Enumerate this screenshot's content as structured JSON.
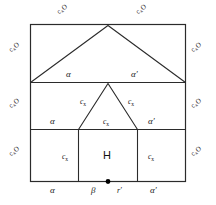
{
  "figure": {
    "stroke_color": "#2b2b2b",
    "text_color": "#1a1a1a",
    "background": "#ffffff",
    "marker_color": "#000000"
  },
  "perimeter_labels": {
    "base": "c",
    "subscript": "x",
    "suffix": "O",
    "top_left": {
      "base": "c",
      "sub": "x",
      "suffix": "O"
    },
    "top_right": {
      "base": "c",
      "sub": "x",
      "suffix": "O"
    },
    "left_upper": {
      "base": "c",
      "sub": "x",
      "suffix": "O"
    },
    "left_middle": {
      "base": "c",
      "sub": "x",
      "suffix": "O"
    },
    "left_lower": {
      "base": "c",
      "sub": "x",
      "suffix": "O"
    },
    "right_upper": {
      "base": "c",
      "sub": "x",
      "suffix": "O"
    },
    "right_middle": {
      "base": "c",
      "sub": "x",
      "suffix": "O"
    },
    "right_lower": {
      "base": "c",
      "sub": "x",
      "suffix": "O"
    }
  },
  "interior_labels": {
    "roof_left_alpha": "α",
    "roof_right_alpha_prime": "α′",
    "mid_left_alpha": "α",
    "mid_right_alpha_prime": "α′",
    "gable_left_cx": {
      "base": "c",
      "sub": "x"
    },
    "gable_right_cx": {
      "base": "c",
      "sub": "x"
    },
    "gable_center_cx": {
      "base": "c",
      "sub": "x"
    },
    "bottom_left_cx": {
      "base": "c",
      "sub": "x"
    },
    "bottom_right_cx": {
      "base": "c",
      "sub": "x"
    },
    "center_cell": "H"
  },
  "bottom_edge_labels": {
    "alpha": "α",
    "beta": "β",
    "r_prime": "r′",
    "alpha_prime": "α′"
  },
  "markers": {
    "origin_dot": "•"
  }
}
